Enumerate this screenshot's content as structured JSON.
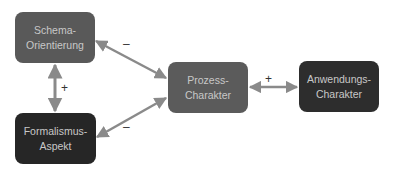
{
  "nodes": {
    "schema": {
      "line1": "Schema-",
      "line2": "Orientierung"
    },
    "formalismus": {
      "line1": "Formalismus-",
      "line2": "Aspekt"
    },
    "prozess": {
      "line1": "Prozess-",
      "line2": "Charakter"
    },
    "anwendung": {
      "line1": "Anwendungs-",
      "line2": "Charakter"
    }
  },
  "edges": [
    {
      "from": "Schema-Orientierung",
      "to": "Prozess-Charakter",
      "label": "–",
      "direction": "both"
    },
    {
      "from": "Schema-Orientierung",
      "to": "Formalismus-Aspekt",
      "label": "+",
      "direction": "both"
    },
    {
      "from": "Formalismus-Aspekt",
      "to": "Prozess-Charakter",
      "label": "–",
      "direction": "both"
    },
    {
      "from": "Prozess-Charakter",
      "to": "Anwendungs-Charakter",
      "label": "+",
      "direction": "both"
    }
  ],
  "colors": {
    "edge": "#8a8a8a",
    "node_medium": "#595959",
    "node_dark": "#262626",
    "node_text": "#c8c8c8"
  }
}
